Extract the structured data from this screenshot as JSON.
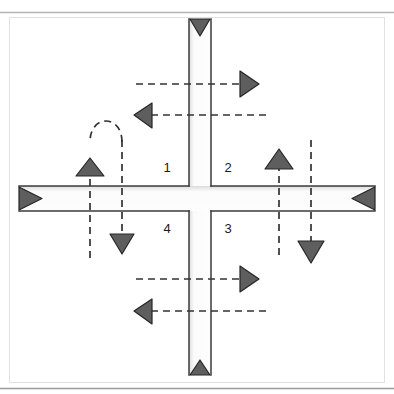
{
  "figure": {
    "background_color": "#ffffff",
    "frame": {
      "top_rule_color": "#b4b4b4",
      "bottom_rule_color": "#9a9a9a",
      "inner_border_color": "#d8d8d8"
    },
    "road": {
      "stroke_color": "#3a3a3a",
      "fill_color": "#fcfcfc",
      "shadow_color": "#c9c9c9",
      "vertical_width_px": 22,
      "horizontal_width_px": 25
    },
    "arrow_color": "#5a5a5a",
    "arrow_outline_color": "#2a2a2a",
    "dash_color": "#333333",
    "dash_pattern": "7 5"
  },
  "quadrants": [
    {
      "id": "q1",
      "label": "1",
      "x": 167,
      "y": 172,
      "position": "upper-left"
    },
    {
      "id": "q2",
      "label": "2",
      "x": 226,
      "y": 172,
      "position": "upper-right"
    },
    {
      "id": "q3",
      "label": "3",
      "x": 226,
      "y": 231,
      "position": "lower-right"
    },
    {
      "id": "q4",
      "label": "4",
      "x": 167,
      "y": 231,
      "position": "lower-left"
    }
  ],
  "road_terminal_arrows": [
    {
      "id": "north-leg-arrow",
      "direction": "down",
      "meaning": "inbound from north",
      "x": 200,
      "y": 27
    },
    {
      "id": "south-leg-arrow",
      "direction": "up",
      "meaning": "inbound from south",
      "x": 200,
      "y": 371
    },
    {
      "id": "west-leg-arrow",
      "direction": "right",
      "meaning": "inbound from west",
      "x": 31,
      "y": 199
    },
    {
      "id": "east-leg-arrow",
      "direction": "left",
      "meaning": "inbound from east",
      "x": 366,
      "y": 199
    }
  ],
  "movements": [
    {
      "id": "north-through-east",
      "type": "horizontal-dashed",
      "direction": "right",
      "label": "upper right-bound movement",
      "y": 84,
      "x_start": 136,
      "x_end": 249
    },
    {
      "id": "north-through-west",
      "type": "horizontal-dashed",
      "direction": "left",
      "label": "upper left-bound movement",
      "y": 115,
      "x_start": 143,
      "x_end": 266
    },
    {
      "id": "south-through-east",
      "type": "horizontal-dashed",
      "direction": "right",
      "label": "lower right-bound movement",
      "y": 279,
      "x_start": 136,
      "x_end": 249
    },
    {
      "id": "south-through-west",
      "type": "horizontal-dashed",
      "direction": "left",
      "label": "lower left-bound movement",
      "y": 311,
      "x_start": 143,
      "x_end": 266
    },
    {
      "id": "west-north-up",
      "type": "vertical-dashed",
      "direction": "up",
      "label": "west-side northbound movement",
      "x": 90,
      "y_start": 258,
      "y_end": 152
    },
    {
      "id": "west-south-down",
      "type": "vertical-dashed",
      "direction": "down",
      "label": "west-side southbound movement",
      "x": 122,
      "y_start": 140,
      "y_end": 243
    },
    {
      "id": "east-north-up",
      "type": "vertical-dashed",
      "direction": "up",
      "label": "east-side northbound movement",
      "x": 279,
      "y_start": 255,
      "y_end": 145
    },
    {
      "id": "east-south-down",
      "type": "vertical-dashed",
      "direction": "down",
      "label": "east-side southbound movement",
      "x": 311,
      "y_start": 140,
      "y_end": 250
    },
    {
      "id": "west-u-turn-loop",
      "type": "u-turn-dashed",
      "direction": "counterclockwise",
      "label": "U-turn loop on west approach",
      "from_x": 122,
      "to_x": 90,
      "apex_y": 128
    }
  ]
}
